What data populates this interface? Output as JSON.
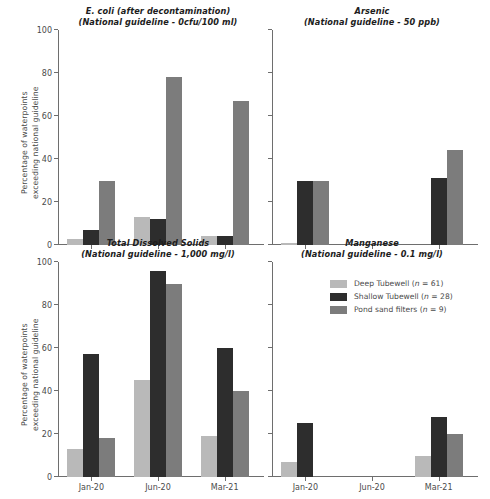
{
  "figure": {
    "ylabel_line1": "Percentage of waterpoints",
    "ylabel_line2": "exceeding national guideline"
  },
  "legend": {
    "position": "inside-bottom-right-panel",
    "items": [
      {
        "label": "Deep Tubewell (n = 61)",
        "name": "Deep Tubewell",
        "n": 61,
        "color": "#b9b9b9"
      },
      {
        "label": "Shallow Tubewell (n = 28)",
        "name": "Shallow Tubewell",
        "n": 28,
        "color": "#2d2d2d"
      },
      {
        "label": "Pond sand filters (n = 9)",
        "name": "Pond sand filters",
        "n": 9,
        "color": "#7c7c7c"
      }
    ]
  },
  "chart_data": [
    {
      "type": "bar",
      "panel": "top-left",
      "title": "E. coli (after decontamination)",
      "subtitle": "(National guideline - 0cfu/100 ml)",
      "categories": [
        "Jan-20",
        "Jun-20",
        "Mar-21"
      ],
      "series": [
        {
          "name": "Deep Tubewell (n = 61)",
          "color": "#b9b9b9",
          "values": [
            3,
            13,
            4
          ]
        },
        {
          "name": "Shallow Tubewell (n = 28)",
          "color": "#2d2d2d",
          "values": [
            7,
            12,
            4
          ]
        },
        {
          "name": "Pond sand filters (n = 9)",
          "color": "#7c7c7c",
          "values": [
            30,
            78,
            67
          ]
        }
      ],
      "xlabel": "",
      "ylabel": "Percentage of waterpoints exceeding national guideline",
      "ylim": [
        0,
        100
      ],
      "yticks": [
        0,
        20,
        40,
        60,
        80,
        100
      ],
      "ytick_labels": [
        "0",
        "20",
        "40",
        "60",
        "80",
        "100"
      ],
      "show_ytick_labels": true,
      "show_xtick_labels": false,
      "grid": false
    },
    {
      "type": "bar",
      "panel": "top-right",
      "title": "Arsenic",
      "subtitle": "(National guideline - 50 ppb)",
      "categories": [
        "Jan-20",
        "Jun-20",
        "Mar-21"
      ],
      "series": [
        {
          "name": "Deep Tubewell (n = 61)",
          "color": "#b9b9b9",
          "values": [
            1,
            0,
            0
          ]
        },
        {
          "name": "Shallow Tubewell (n = 28)",
          "color": "#2d2d2d",
          "values": [
            30,
            0,
            31
          ]
        },
        {
          "name": "Pond sand filters (n = 9)",
          "color": "#7c7c7c",
          "values": [
            30,
            0,
            44
          ]
        }
      ],
      "xlabel": "",
      "ylabel": "",
      "ylim": [
        0,
        100
      ],
      "yticks": [
        0,
        20,
        40,
        60,
        80,
        100
      ],
      "ytick_labels": [
        "",
        "",
        "",
        "",
        "",
        ""
      ],
      "show_ytick_labels": false,
      "show_xtick_labels": false,
      "grid": false
    },
    {
      "type": "bar",
      "panel": "bottom-left",
      "title": "Total Dissolved Solids",
      "subtitle": "(National guideline - 1,000 mg/l)",
      "categories": [
        "Jan-20",
        "Jun-20",
        "Mar-21"
      ],
      "series": [
        {
          "name": "Deep Tubewell (n = 61)",
          "color": "#b9b9b9",
          "values": [
            13,
            45,
            19
          ]
        },
        {
          "name": "Shallow Tubewell (n = 28)",
          "color": "#2d2d2d",
          "values": [
            57,
            96,
            60
          ]
        },
        {
          "name": "Pond sand filters (n = 9)",
          "color": "#7c7c7c",
          "values": [
            18,
            90,
            40
          ]
        }
      ],
      "xlabel": "",
      "ylabel": "Percentage of waterpoints exceeding national guideline",
      "ylim": [
        0,
        100
      ],
      "yticks": [
        0,
        20,
        40,
        60,
        80,
        100
      ],
      "ytick_labels": [
        "0",
        "20",
        "40",
        "60",
        "80",
        "100"
      ],
      "show_ytick_labels": true,
      "show_xtick_labels": true,
      "grid": false
    },
    {
      "type": "bar",
      "panel": "bottom-right",
      "title": "Manganese",
      "subtitle": "(National guideline - 0.1 mg/l)",
      "categories": [
        "Jan-20",
        "Jun-20",
        "Mar-21"
      ],
      "series": [
        {
          "name": "Deep Tubewell (n = 61)",
          "color": "#b9b9b9",
          "values": [
            7,
            0,
            10
          ]
        },
        {
          "name": "Shallow Tubewell (n = 28)",
          "color": "#2d2d2d",
          "values": [
            25,
            0,
            28
          ]
        },
        {
          "name": "Pond sand filters (n = 9)",
          "color": "#7c7c7c",
          "values": [
            0,
            0,
            20
          ]
        }
      ],
      "xlabel": "",
      "ylabel": "",
      "ylim": [
        0,
        100
      ],
      "yticks": [
        0,
        20,
        40,
        60,
        80,
        100
      ],
      "ytick_labels": [
        "",
        "",
        "",
        "",
        "",
        ""
      ],
      "show_ytick_labels": false,
      "show_xtick_labels": true,
      "grid": false
    }
  ]
}
